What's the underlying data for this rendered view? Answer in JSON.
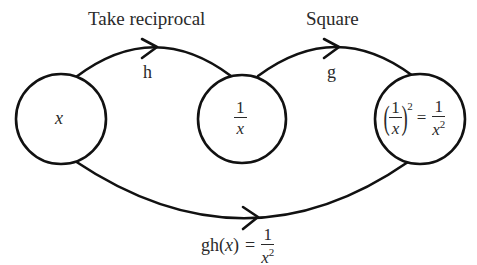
{
  "diagram": {
    "nodes": [
      {
        "id": "x",
        "label": "x",
        "cx": 61,
        "cy": 119,
        "r": 45
      },
      {
        "id": "reciprocal",
        "numerator": "1",
        "denominator": "x",
        "cx": 242,
        "cy": 119,
        "r": 44
      },
      {
        "id": "square",
        "lhs_numerator": "1",
        "lhs_denominator": "x",
        "lhs_power": "2",
        "equals": "=",
        "rhs_numerator": "1",
        "rhs_denominator": "x",
        "rhs_power": "2",
        "cx": 420,
        "cy": 119,
        "r": 45
      }
    ],
    "edges": [
      {
        "from": "x",
        "to": "reciprocal",
        "function": "h",
        "description": "Take reciprocal"
      },
      {
        "from": "reciprocal",
        "to": "square",
        "function": "g",
        "description": "Square"
      },
      {
        "from": "x",
        "to": "square",
        "function": "gh",
        "description": "gh(x) = 1/x²"
      }
    ],
    "labels": {
      "edge1_title": "Take reciprocal",
      "edge1_fn": "h",
      "edge2_title": "Square",
      "edge2_fn": "g",
      "composite_lhs": "gh(",
      "composite_var": "x",
      "composite_close": ")",
      "composite_eq": "=",
      "composite_num": "1",
      "composite_den": "x",
      "composite_pow": "2"
    },
    "colors": {
      "stroke": "#111111",
      "text": "#2a2a2a",
      "background": "#ffffff"
    }
  }
}
